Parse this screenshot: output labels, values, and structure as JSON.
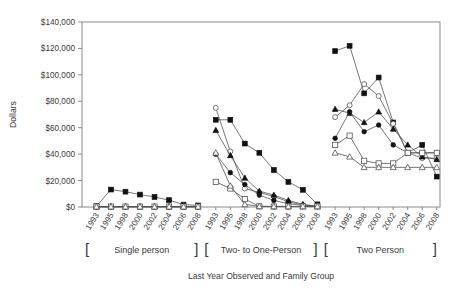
{
  "chart_data": {
    "type": "line",
    "title": "",
    "xlabel": "Last Year Observed and Family Group",
    "ylabel": "Dollars",
    "ylim": [
      0,
      140000
    ],
    "ytick_labels": [
      "$0",
      "$20,000",
      "$40,000",
      "$60,000",
      "$80,000",
      "$100,000",
      "$120,000",
      "$140,000"
    ],
    "ytick_values": [
      0,
      20000,
      40000,
      60000,
      80000,
      100000,
      120000,
      140000
    ],
    "grid": false,
    "legend": "none",
    "x_group_labels": [
      "Single person",
      "Two- to One-Person",
      "Two Person"
    ],
    "categories": [
      "1993",
      "1995",
      "1998",
      "2000",
      "2002",
      "2004",
      "2006",
      "2008"
    ],
    "marker_styles": [
      "filled-square",
      "open-circle",
      "filled-triangle",
      "filled-circle",
      "open-square",
      "open-triangle"
    ],
    "groups": [
      {
        "name": "Single person",
        "series": [
          {
            "name": "filled-square",
            "marker": "filled-square",
            "values": [
              600,
              13200,
              11600,
              9400,
              7600,
              5200,
              1800,
              1200
            ]
          },
          {
            "name": "open-circle",
            "marker": "open-circle",
            "values": [
              300,
              300,
              300,
              300,
              300,
              300,
              300,
              300
            ]
          },
          {
            "name": "filled-triangle",
            "marker": "filled-triangle",
            "values": [
              200,
              200,
              200,
              200,
              200,
              200,
              200,
              200
            ]
          },
          {
            "name": "filled-circle",
            "marker": "filled-circle",
            "values": [
              200,
              200,
              200,
              200,
              200,
              200,
              200,
              200
            ]
          },
          {
            "name": "open-square",
            "marker": "open-square",
            "values": [
              300,
              300,
              300,
              300,
              300,
              300,
              300,
              300
            ]
          },
          {
            "name": "open-triangle",
            "marker": "open-triangle",
            "values": [
              200,
              200,
              200,
              200,
              200,
              200,
              200,
              200
            ]
          }
        ]
      },
      {
        "name": "Two- to One-Person",
        "series": [
          {
            "name": "filled-square",
            "marker": "filled-square",
            "values": [
              66000,
              66000,
              48000,
              41000,
              28000,
              19000,
              13000,
              2000
            ]
          },
          {
            "name": "open-circle",
            "marker": "open-circle",
            "values": [
              75000,
              42000,
              14000,
              11000,
              8000,
              4000,
              1500,
              600
            ]
          },
          {
            "name": "filled-triangle",
            "marker": "filled-triangle",
            "values": [
              58000,
              39000,
              22000,
              12000,
              9000,
              5000,
              2000,
              600
            ]
          },
          {
            "name": "filled-circle",
            "marker": "filled-circle",
            "values": [
              40000,
              26000,
              17000,
              9000,
              5000,
              2500,
              1200,
              500
            ]
          },
          {
            "name": "open-square",
            "marker": "open-square",
            "values": [
              19000,
              14000,
              6000,
              500,
              400,
              400,
              400,
              400
            ]
          },
          {
            "name": "open-triangle",
            "marker": "open-triangle",
            "values": [
              41000,
              16000,
              2000,
              500,
              400,
              400,
              400,
              400
            ]
          }
        ]
      },
      {
        "name": "Two Person",
        "series": [
          {
            "name": "filled-square",
            "marker": "filled-square",
            "values": [
              118000,
              122000,
              86000,
              98000,
              64000,
              41000,
              47000,
              23000
            ]
          },
          {
            "name": "open-circle",
            "marker": "open-circle",
            "values": [
              68000,
              77000,
              93000,
              84000,
              63000,
              41000,
              37000,
              37000
            ]
          },
          {
            "name": "filled-triangle",
            "marker": "filled-triangle",
            "values": [
              74000,
              71000,
              64000,
              72000,
              59000,
              47000,
              38000,
              36000
            ]
          },
          {
            "name": "filled-circle",
            "marker": "filled-circle",
            "values": [
              52000,
              72000,
              57000,
              62000,
              47000,
              41000,
              41000,
              41000
            ]
          },
          {
            "name": "open-square",
            "marker": "open-square",
            "values": [
              47000,
              54000,
              35000,
              33000,
              33000,
              41000,
              41000,
              41000
            ]
          },
          {
            "name": "open-triangle",
            "marker": "open-triangle",
            "values": [
              41000,
              38000,
              30000,
              30000,
              30000,
              30000,
              30000,
              30000
            ]
          }
        ]
      }
    ]
  },
  "axes": {
    "y_title": "Dollars",
    "x_title": "Last Year Observed and Family Group"
  }
}
